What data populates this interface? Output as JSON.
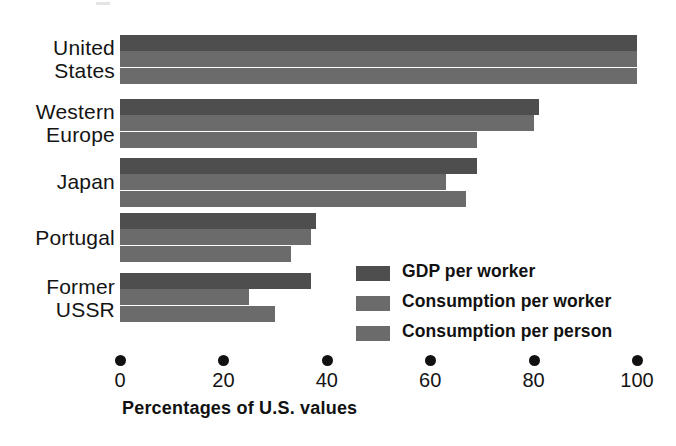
{
  "chart_data": {
    "type": "bar",
    "orientation": "horizontal",
    "title": "",
    "xlabel": "Percentages of U.S. values",
    "ylabel": "",
    "xlim": [
      0,
      100
    ],
    "xticks": [
      0,
      20,
      40,
      60,
      80,
      100
    ],
    "xtick_labels": [
      "0",
      "20",
      "40",
      "60",
      "80",
      "100"
    ],
    "grid": false,
    "legend_position": "inside-lower-right",
    "categories": [
      "United\nStates",
      "Western\nEurope",
      "Japan",
      "Portugal",
      "Former\nUSSR"
    ],
    "series": [
      {
        "name": "GDP per worker",
        "color": "#4e4e4e",
        "values": [
          100,
          81,
          69,
          38,
          37
        ]
      },
      {
        "name": "Consumption per worker",
        "color": "#6b6b6b",
        "values": [
          100,
          80,
          63,
          37,
          25
        ]
      },
      {
        "name": "Consumption per person",
        "color": "#6b6b6b",
        "values": [
          100,
          69,
          67,
          33,
          30
        ]
      }
    ]
  },
  "axis": {
    "title": "Percentages of U.S. values",
    "ticks": [
      "0",
      "20",
      "40",
      "60",
      "80",
      "100"
    ]
  },
  "legend": {
    "items": [
      {
        "label": "GDP per worker",
        "color": "#4e4e4e"
      },
      {
        "label": "Consumption per worker",
        "color": "#6b6b6b"
      },
      {
        "label": "Consumption per person",
        "color": "#6b6b6b"
      }
    ]
  },
  "categories": [
    {
      "label": "United\nStates"
    },
    {
      "label": "Western\nEurope"
    },
    {
      "label": "Japan"
    },
    {
      "label": "Portugal"
    },
    {
      "label": "Former\nUSSR"
    }
  ]
}
